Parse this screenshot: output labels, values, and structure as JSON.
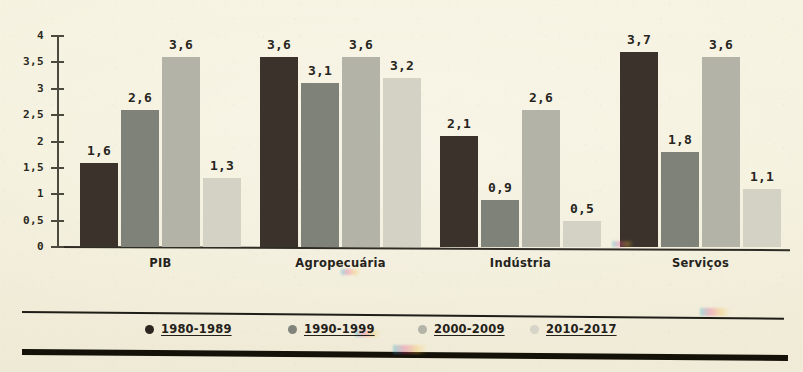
{
  "chart_data": {
    "type": "bar",
    "title": "",
    "subtitle": "",
    "xlabel": "",
    "ylabel": "",
    "grid": false,
    "legend_position": "bottom",
    "ylim": [
      0,
      4
    ],
    "ytick_labels": [
      "0",
      "0,5",
      "1",
      "1,5",
      "2",
      "2,5",
      "3",
      "3,5",
      "4"
    ],
    "ytick_values": [
      0,
      0.5,
      1,
      1.5,
      2,
      2.5,
      3,
      3.5,
      4
    ],
    "decimal_separator": ",",
    "categories": [
      "PIB",
      "Agropecuária",
      "Indústria",
      "Serviços"
    ],
    "series": [
      {
        "name": "1980-1989",
        "color": "#3a322b",
        "values": [
          1.6,
          3.6,
          2.1,
          3.7
        ],
        "labels": [
          "1,6",
          "3,6",
          "2,1",
          "3,7"
        ]
      },
      {
        "name": "1990-1999",
        "color": "#7e8279",
        "values": [
          2.6,
          3.1,
          0.9,
          1.8
        ],
        "labels": [
          "2,6",
          "3,1",
          "0,9",
          "1,8"
        ]
      },
      {
        "name": "2000-2009",
        "color": "#b3b3a8",
        "values": [
          3.6,
          3.6,
          2.6,
          3.6
        ],
        "labels": [
          "3,6",
          "3,6",
          "2,6",
          "3,6"
        ]
      },
      {
        "name": "2010-2017",
        "color": "#d4d2c5",
        "values": [
          1.3,
          3.2,
          0.5,
          1.1
        ],
        "labels": [
          "1,3",
          "3,2",
          "0,5",
          "1,1"
        ]
      }
    ]
  },
  "legend": {
    "marker_icon": "filled-circle-marker",
    "entries": [
      {
        "label": "1980-1989",
        "color": "#2c2620"
      },
      {
        "label": "1990-1999",
        "color": "#80847b"
      },
      {
        "label": "2000-2009",
        "color": "#b3b3a8"
      },
      {
        "label": "2010-2017",
        "color": "#d6d4c8"
      }
    ]
  },
  "axes": {
    "y_axis_name": "value-axis",
    "x_axis_name": "category-axis"
  },
  "colors": {
    "paper_background": "#f5f1de",
    "axis": "#4c4a3e",
    "baseline": "#2e2c24",
    "text": "#25231c",
    "rule_dark": "#141208"
  }
}
